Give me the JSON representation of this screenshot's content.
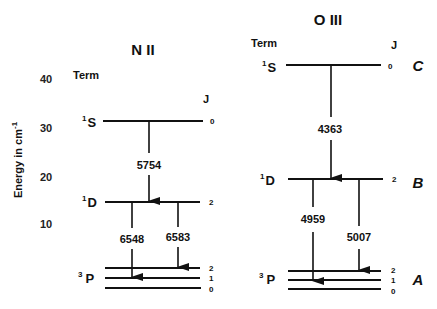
{
  "axis": {
    "label": "Energy in cm",
    "label_sup": "-1",
    "ticks": [
      "40",
      "30",
      "20",
      "10"
    ]
  },
  "panels": [
    {
      "ion": "N II",
      "term_header": "Term",
      "j_header": "J",
      "levels": [
        {
          "term": "S",
          "multiplicity": "1",
          "j": [
            "0"
          ],
          "tag": ""
        },
        {
          "term": "D",
          "multiplicity": "1",
          "j": [
            "2"
          ],
          "tag": ""
        },
        {
          "term": "P",
          "multiplicity": "3",
          "j": [
            "2",
            "1",
            "0"
          ],
          "tag": ""
        }
      ],
      "transitions": [
        "5754",
        "6548",
        "6583"
      ]
    },
    {
      "ion": "O III",
      "term_header": "Term",
      "j_header": "J",
      "levels": [
        {
          "term": "S",
          "multiplicity": "1",
          "j": [
            "0"
          ],
          "tag": "C"
        },
        {
          "term": "D",
          "multiplicity": "1",
          "j": [
            "2"
          ],
          "tag": "B"
        },
        {
          "term": "P",
          "multiplicity": "3",
          "j": [
            "2",
            "1",
            "0"
          ],
          "tag": "A"
        }
      ],
      "transitions": [
        "4363",
        "4959",
        "5007"
      ]
    }
  ]
}
